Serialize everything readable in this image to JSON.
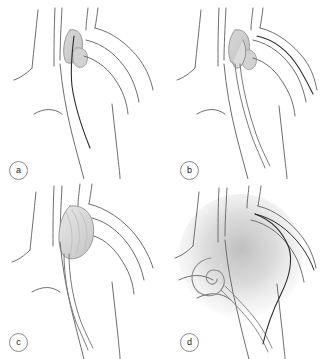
{
  "figure": {
    "background_color": "#ffffff",
    "width": 326,
    "height": 359,
    "layout": "2x2 panel grid",
    "panel_count": 4
  },
  "style": {
    "vessel_outline_color": "#6e6e6e",
    "catheter_color": "#2b2b2b",
    "device_fill_color": "#d6d6d6",
    "sac_fill_color": "#cfcfcf",
    "shading_color": "#c9c9c9",
    "label_border_color": "#8a8a8a",
    "label_text_color": "#1a1a1a"
  },
  "panels": [
    {
      "id": "a",
      "label": "a",
      "caption": "Guidewire advanced through the aortic arch past the aneurysm neck",
      "features": [
        "aortic arch outline",
        "brachiocephalic branch",
        "left common carotid branch",
        "left subclavian branch",
        "descending aorta",
        "shaded aneurysm sac at branch origin",
        "guidewire"
      ]
    },
    {
      "id": "b",
      "label": "b",
      "caption": "Delivery catheter positioned at the aneurysm neck",
      "features": [
        "aortic arch outline",
        "branch vessels",
        "shaded aneurysm sac",
        "delivery catheter sheath",
        "device tip in sac"
      ]
    },
    {
      "id": "c",
      "label": "c",
      "caption": "Occluder device expanded within the aneurysm sac",
      "features": [
        "aortic arch outline",
        "branch vessels",
        "expanded occluder device filling sac",
        "delivery catheter"
      ]
    },
    {
      "id": "d",
      "label": "d",
      "caption": "Pigtail catheter coiled in the branch vessel after exclusion, with contrast opacification",
      "features": [
        "aortic arch outline",
        "branch vessels",
        "pigtail catheter coil",
        "guidewire",
        "contrast shading of arch"
      ]
    }
  ]
}
